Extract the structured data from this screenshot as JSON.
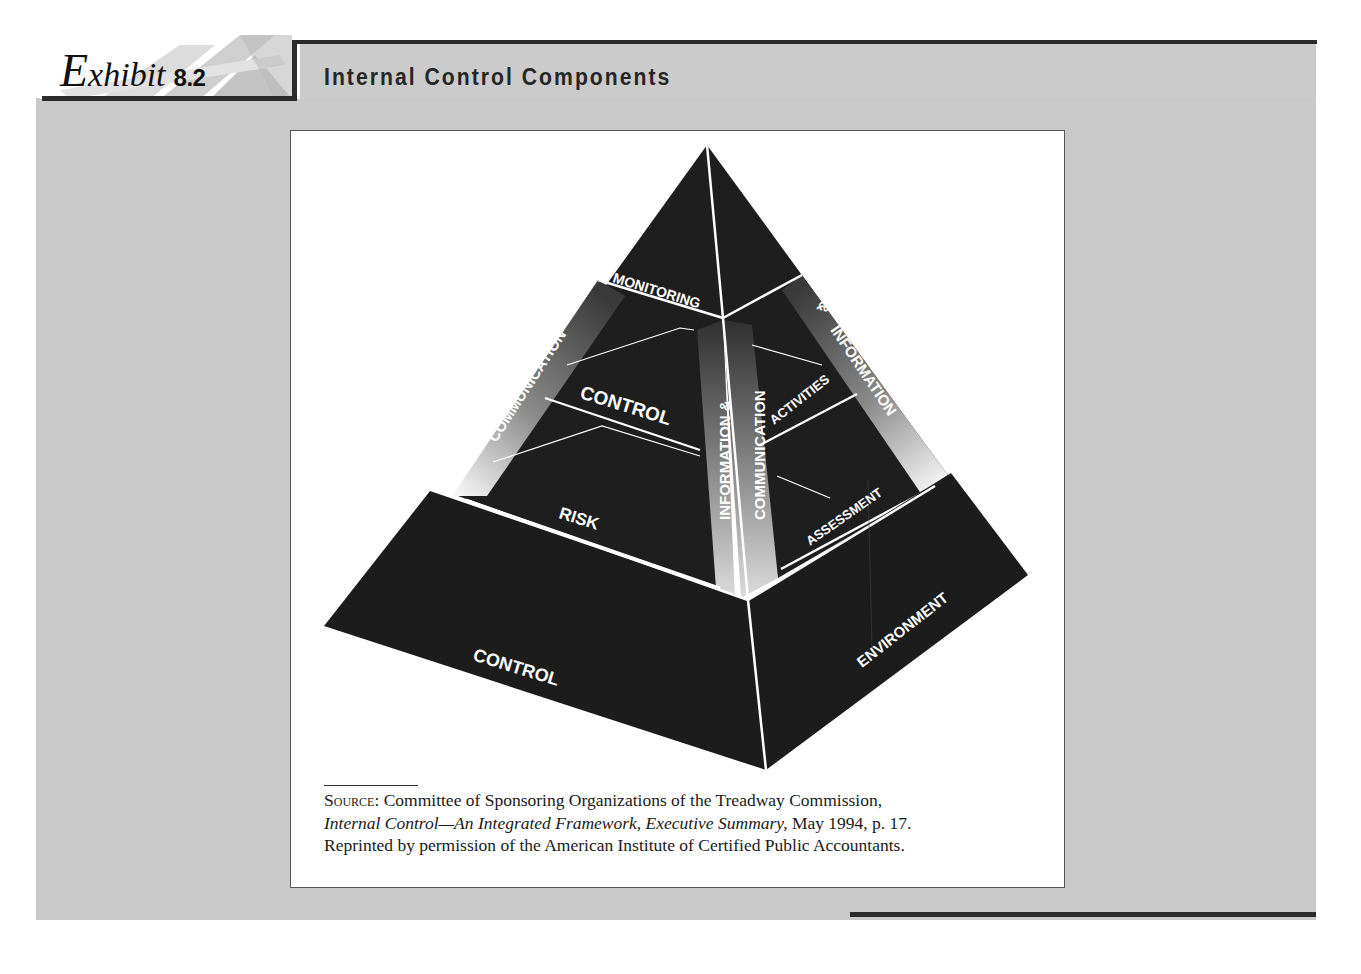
{
  "header": {
    "exhibit_word_initial": "E",
    "exhibit_word_rest": "xhibit",
    "exhibit_number": "8.2",
    "title": "Internal Control Components"
  },
  "diagram": {
    "type": "pyramid",
    "layers_bottom_to_top": [
      {
        "name": "Control Environment",
        "left_face_label": "CONTROL",
        "right_face_label": "ENVIRONMENT"
      },
      {
        "name": "Risk Assessment",
        "left_face_label": "RISK",
        "right_face_label": "ASSESSMENT"
      },
      {
        "name": "Control Activities",
        "left_face_label": "CONTROL",
        "right_face_label": "ACTIVITIES"
      },
      {
        "name": "Monitoring",
        "left_face_label": "MONITORING",
        "right_face_label": ""
      }
    ],
    "side_bands": {
      "left_edge": "COMMUNICATION",
      "center_left": "INFORMATION &",
      "center_right": "COMMUNICATION",
      "right_edge_part1": "INFORMATION",
      "right_edge_part2": "&"
    },
    "colors": {
      "face": "#1e1e1e",
      "line": "#ffffff",
      "panel": "#c9c9c9",
      "rule": "#2b2b2b"
    }
  },
  "source": {
    "label": "Source:",
    "line1": " Committee of Sponsoring Organizations of the Treadway Commission,",
    "line2_italic": "Internal Control—An Integrated Framework, Executive Summary,",
    "line2_rest": " May 1994, p. 17.",
    "line3": "Reprinted by permission of the American Institute of Certified Public Accountants."
  }
}
